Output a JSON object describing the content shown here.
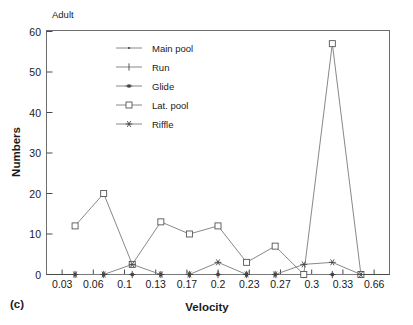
{
  "panel": {
    "label": "(c)",
    "subtitle": "Adult"
  },
  "chart_data": {
    "type": "line",
    "title": "Adult",
    "xlabel": "Velocity",
    "ylabel": "Numbers",
    "categories": [
      "0.03",
      "0.06",
      "0.1",
      "0.13",
      "0.17",
      "0.2",
      "0.23",
      "0.27",
      "0.3",
      "0.33",
      "0.66"
    ],
    "x_tick_labels": [
      "0.03",
      "0.06",
      "0.1",
      "0.13",
      "0.17",
      "0.2",
      "0.23",
      "0.27",
      "0.3",
      "0.33",
      "0.66"
    ],
    "y_tick_labels": [
      "0",
      "10",
      "20",
      "30",
      "40",
      "50",
      "60"
    ],
    "y_ticks": [
      0,
      10,
      20,
      30,
      40,
      50,
      60
    ],
    "ylim": [
      0,
      60
    ],
    "grid": false,
    "legend_position": "upper-left-inside",
    "series": [
      {
        "name": "Main pool",
        "marker": "dot",
        "values": [
          0,
          0,
          0,
          0,
          0,
          0,
          0,
          0,
          0,
          0,
          0
        ]
      },
      {
        "name": "Run",
        "marker": "plus",
        "values": [
          0,
          0,
          0,
          0,
          0,
          0,
          0,
          0,
          0,
          0,
          0
        ]
      },
      {
        "name": "Glide",
        "marker": "filled-square",
        "values": [
          0,
          0,
          0,
          0,
          0,
          0,
          0,
          0,
          0,
          0,
          0
        ]
      },
      {
        "name": "Lat. pool",
        "marker": "open-square",
        "values": [
          12,
          20,
          2.5,
          13,
          10,
          12,
          3,
          7,
          0,
          57,
          0
        ]
      },
      {
        "name": "Riffle",
        "marker": "asterisk",
        "values": [
          0,
          0,
          2.5,
          0,
          0,
          3,
          0,
          0,
          2.5,
          3,
          0
        ]
      }
    ]
  },
  "axes": {
    "x_title": "Velocity",
    "y_title": "Numbers"
  },
  "legend": {
    "items": [
      {
        "label": "Main pool",
        "marker": "dot"
      },
      {
        "label": "Run",
        "marker": "plus"
      },
      {
        "label": "Glide",
        "marker": "filled-square"
      },
      {
        "label": "Lat. pool",
        "marker": "open-square"
      },
      {
        "label": "Riffle",
        "marker": "asterisk"
      }
    ]
  },
  "colors": {
    "line": "#7a7a7a",
    "frame": "#6e6e6e",
    "text": "#1a1a1a",
    "background": "#ffffff"
  }
}
